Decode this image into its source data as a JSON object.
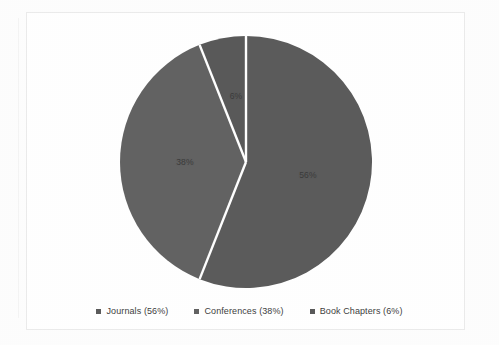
{
  "chart_data": {
    "type": "pie",
    "title": "",
    "categories": [
      "Journals",
      "Conferences",
      "Book Chapters"
    ],
    "values": [
      56,
      38,
      6
    ],
    "unit": "%",
    "start_angle_deg": 0,
    "direction": "clockwise",
    "data_labels": [
      "56%",
      "38%",
      "6%"
    ],
    "legend_entries": [
      "Journals (56%)",
      "Conferences (38%)",
      "Book Chapters (6%)"
    ],
    "legend_position": "bottom",
    "slice_colors": [
      "#5b5b5b",
      "#626262",
      "#595959"
    ],
    "separator_color": "#ffffff",
    "grid": false
  },
  "frame": {
    "border_color": "#ebebeb"
  },
  "pie": {
    "labels": [
      {
        "text": "56%",
        "x": 308,
        "y": 175
      },
      {
        "text": "38%",
        "x": 185,
        "y": 162
      },
      {
        "text": "6%",
        "x": 236,
        "y": 96
      }
    ]
  },
  "legend": {
    "items": [
      {
        "label": "Journals (56%)",
        "color": "#5b5b5b"
      },
      {
        "label": "Conferences (38%)",
        "color": "#626262"
      },
      {
        "label": "Book Chapters (6%)",
        "color": "#595959"
      }
    ]
  }
}
